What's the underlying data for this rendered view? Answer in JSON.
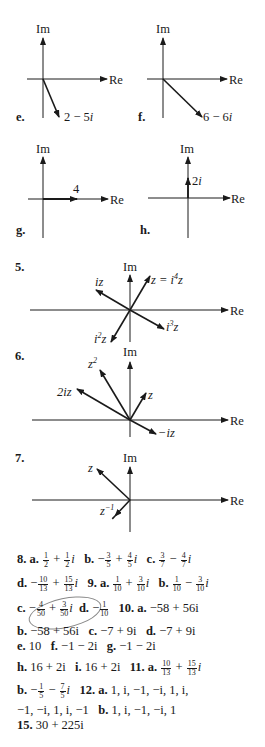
{
  "diagrams": {
    "e": {
      "label": "e.",
      "vector": "2 − 5i",
      "axis_im": "Im",
      "axis_re": "Re"
    },
    "f": {
      "label": "f.",
      "vector": "6 − 6i",
      "axis_im": "Im",
      "axis_re": "Re"
    },
    "g": {
      "label": "g.",
      "vector": "4",
      "axis_im": "Im",
      "axis_re": "Re"
    },
    "h": {
      "label": "h.",
      "vector": "2i",
      "axis_im": "Im",
      "axis_re": "Re"
    },
    "p5": {
      "label": "5.",
      "axis_im": "Im",
      "axis_re": "Re",
      "vectors": [
        "z = i⁴z",
        "iz",
        "i²z",
        "i³z"
      ]
    },
    "p6": {
      "label": "6.",
      "axis_im": "Im",
      "axis_re": "Re",
      "vectors": [
        "z²",
        "2iz",
        "z",
        "−iz"
      ]
    },
    "p7": {
      "label": "7.",
      "axis_im": "Im",
      "axis_re": "Re",
      "vectors": [
        "z",
        "z⁻¹",
        "z̄"
      ]
    }
  },
  "answers": {
    "p8": {
      "num": "8.",
      "a": "a.",
      "b": "b.",
      "c": "c.",
      "d": "d."
    },
    "p9": {
      "num": "9.",
      "a": "a.",
      "b": "b.",
      "c": "c.",
      "d": "d."
    },
    "p10": {
      "num": "10.",
      "a": "a.",
      "a_val": "−58 + 56i",
      "b": "b.",
      "b_val": "−58 + 56i",
      "c": "c.",
      "c_val": "−7 + 9i",
      "d": "d.",
      "d_val": "−7 + 9i",
      "e": "e.",
      "e_val": "10",
      "f": "f.",
      "f_val": "−1 − 2i",
      "g": "g.",
      "g_val": "−1 − 2i",
      "h": "h.",
      "h_val": "16 + 2i",
      "i": "i.",
      "i_val": "16 + 2i"
    },
    "p11": {
      "num": "11.",
      "a": "a.",
      "b": "b."
    },
    "p12": {
      "num": "12.",
      "a": "a.",
      "a_val1": "1, i, −1, −i, 1, i,",
      "a_val2": "−1, −i, 1, i, −1",
      "b": "b.",
      "b_val": "1, i, −1, −i, 1"
    },
    "p15": {
      "num": "15.",
      "val": "30 + 225i"
    }
  }
}
